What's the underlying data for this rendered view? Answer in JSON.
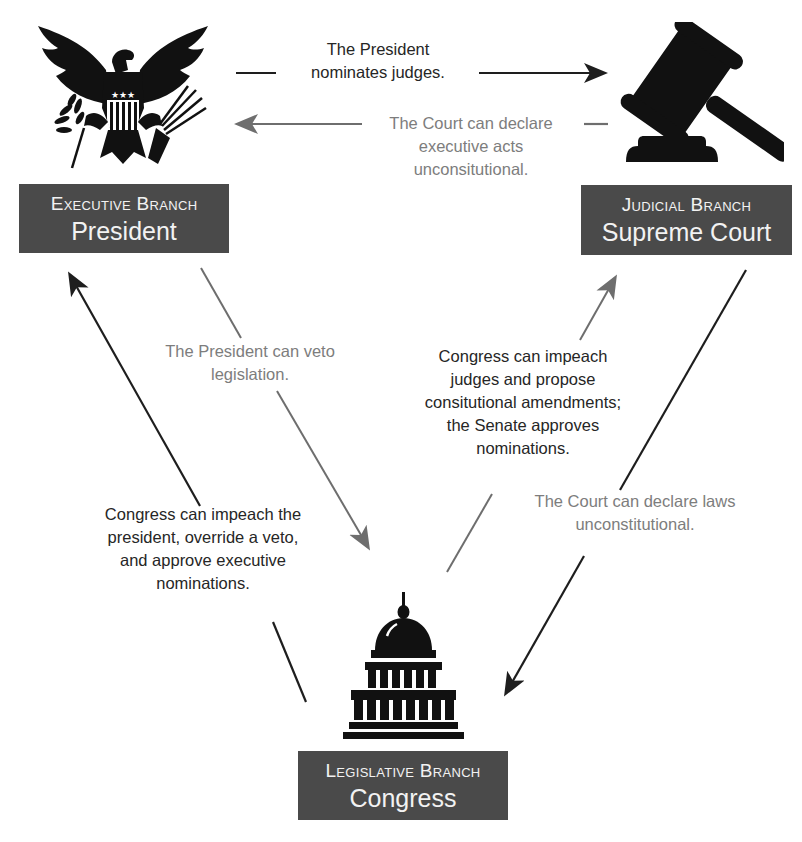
{
  "diagram": {
    "colors": {
      "box_fill": "#4a4a4a",
      "box_text": "#f2f2f2",
      "dark_text": "#262626",
      "grey_text": "#7d7d7d",
      "dark_arrow": "#1e1e1e",
      "grey_arrow": "#6e6e6e"
    },
    "branches": {
      "executive": {
        "branch_label": "Executive Branch",
        "name": "President",
        "icon": "eagle-seal-icon"
      },
      "judicial": {
        "branch_label": "Judicial Branch",
        "name": "Supreme Court",
        "icon": "gavel-icon"
      },
      "legislative": {
        "branch_label": "Legislative Branch",
        "name": "Congress",
        "icon": "capitol-dome-icon"
      }
    },
    "relations": [
      {
        "id": "exec_to_jud",
        "from": "executive",
        "to": "judicial",
        "style": "dark",
        "lines": [
          "The President",
          "nominates judges."
        ]
      },
      {
        "id": "jud_to_exec",
        "from": "judicial",
        "to": "executive",
        "style": "grey",
        "lines": [
          "The Court can declare",
          "executive acts",
          "unconsitutional."
        ]
      },
      {
        "id": "exec_to_leg",
        "from": "executive",
        "to": "legislative",
        "style": "grey",
        "lines": [
          "The President can veto",
          "legislation."
        ]
      },
      {
        "id": "leg_to_exec",
        "from": "legislative",
        "to": "executive",
        "style": "dark",
        "lines": [
          "Congress can impeach the",
          "president, override a veto,",
          "and approve executive",
          "nominations."
        ]
      },
      {
        "id": "leg_to_jud",
        "from": "legislative",
        "to": "judicial",
        "style": "dark",
        "lines": [
          "Congress can impeach",
          "judges and propose",
          "consitutional amendments;",
          "the Senate approves",
          "nominations."
        ]
      },
      {
        "id": "jud_to_leg",
        "from": "judicial",
        "to": "legislative",
        "style": "grey",
        "lines": [
          "The Court can declare laws",
          "unconstitutional."
        ]
      }
    ]
  }
}
